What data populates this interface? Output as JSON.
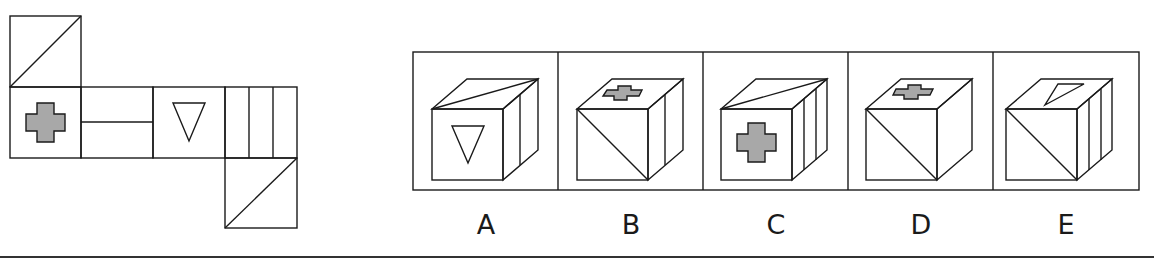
{
  "puzzle": {
    "type": "cube-net-folding",
    "net": {
      "faces": [
        {
          "id": "top-flap",
          "symbol": "diagonal-line"
        },
        {
          "id": "cross",
          "symbol": "grey-cross"
        },
        {
          "id": "half-line",
          "symbol": "horizontal-line"
        },
        {
          "id": "triangle",
          "symbol": "inverted-triangle"
        },
        {
          "id": "stripes",
          "symbol": "three-vertical-stripes"
        },
        {
          "id": "bottom-flap",
          "symbol": "diagonal-line"
        }
      ]
    },
    "options": [
      {
        "label": "A",
        "front": "inverted-triangle",
        "top": "diagonal-line",
        "side": "vertical-stripes"
      },
      {
        "label": "B",
        "front": "diagonal-line",
        "top": "grey-cross",
        "side": "vertical-stripe"
      },
      {
        "label": "C",
        "front": "grey-cross",
        "top": "diagonal-line",
        "side": "vertical-stripes"
      },
      {
        "label": "D",
        "front": "diagonal-line",
        "top": "grey-cross",
        "side": "blank"
      },
      {
        "label": "E",
        "front": "diagonal-line",
        "top": "triangle",
        "side": "vertical-stripes"
      }
    ]
  },
  "colors": {
    "line": "#1a1a1a",
    "fill_grey": "#a8a8a8",
    "background": "#ffffff"
  }
}
